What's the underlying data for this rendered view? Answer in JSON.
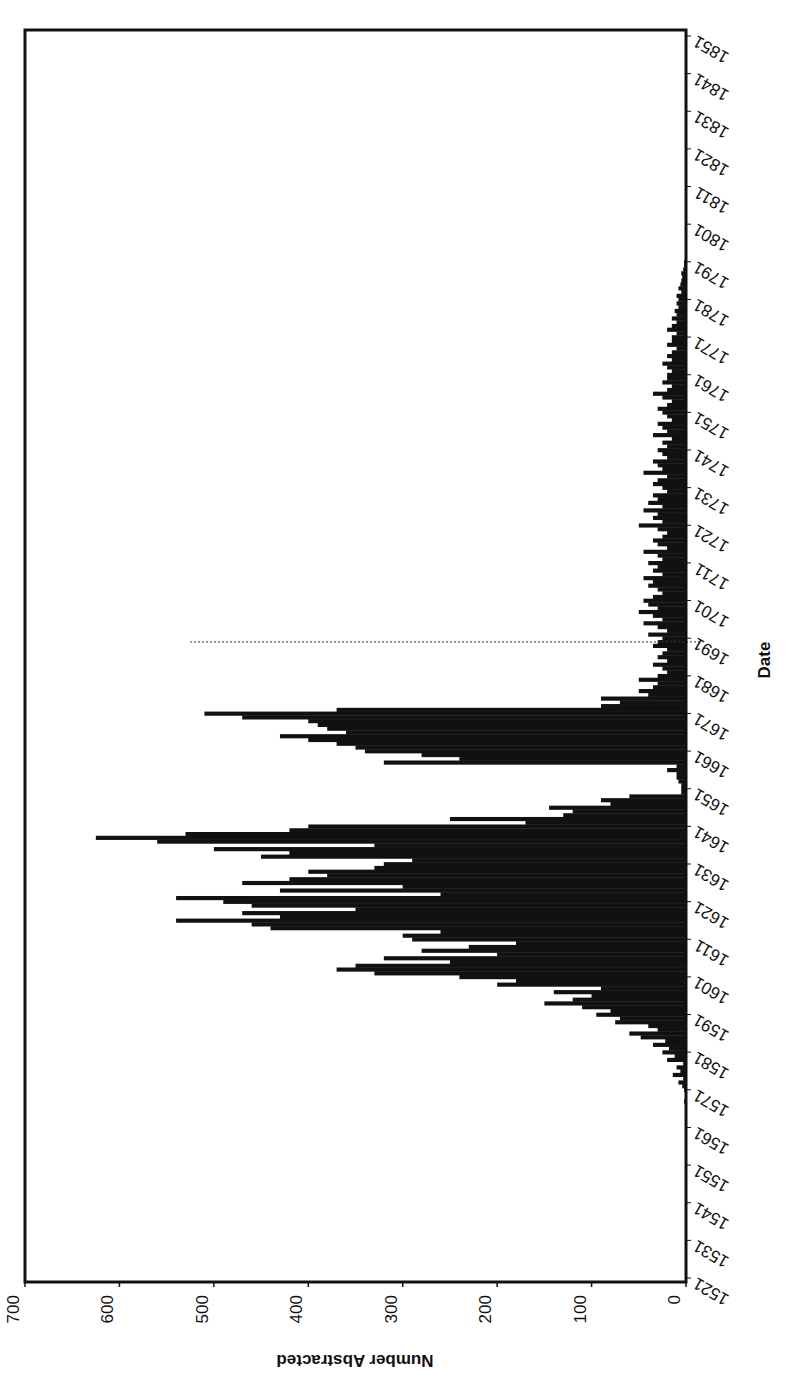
{
  "chart_data": {
    "type": "bar",
    "orientation": "rotated-90 (page printed sideways; value axis horizontal, reversed)",
    "title": "",
    "xlabel": "Date",
    "ylabel": "Number Abstracted",
    "ylim": [
      0,
      700
    ],
    "y_ticks": [
      0,
      100,
      200,
      300,
      400,
      500,
      600,
      700
    ],
    "x_tick_labels": [
      "1521",
      "1531",
      "1541",
      "1551",
      "1561",
      "1571",
      "1581",
      "1591",
      "1601",
      "1611",
      "1621",
      "1631",
      "1641",
      "1651",
      "1661",
      "1671",
      "1681",
      "1691",
      "1701",
      "1711",
      "1721",
      "1731",
      "1741",
      "1751",
      "1761",
      "1771",
      "1781",
      "1791",
      "1801",
      "1811",
      "1821",
      "1831",
      "1841",
      "1851"
    ],
    "xrange": [
      1521,
      1851
    ],
    "annotation": {
      "type": "dotted-reference-line",
      "at_year": 1690
    },
    "grid": false,
    "legend": null,
    "bar_color": "#111111",
    "categories_start": 1521,
    "values": [
      0,
      0,
      0,
      0,
      0,
      0,
      0,
      0,
      0,
      0,
      0,
      0,
      0,
      0,
      0,
      0,
      0,
      0,
      0,
      0,
      0,
      0,
      0,
      0,
      0,
      0,
      0,
      0,
      0,
      0,
      0,
      0,
      0,
      0,
      0,
      0,
      0,
      0,
      0,
      0,
      0,
      0,
      0,
      0,
      0,
      1,
      1,
      2,
      1,
      1,
      2,
      4,
      8,
      3,
      14,
      6,
      10,
      3,
      20,
      12,
      25,
      18,
      35,
      22,
      48,
      60,
      30,
      40,
      75,
      70,
      95,
      80,
      110,
      150,
      120,
      100,
      140,
      90,
      200,
      180,
      240,
      330,
      370,
      350,
      250,
      320,
      200,
      280,
      230,
      180,
      290,
      300,
      260,
      440,
      460,
      540,
      430,
      470,
      350,
      460,
      490,
      540,
      260,
      430,
      300,
      470,
      420,
      380,
      400,
      330,
      320,
      290,
      450,
      420,
      500,
      330,
      560,
      625,
      530,
      420,
      400,
      170,
      250,
      130,
      120,
      145,
      80,
      90,
      60,
      5,
      5,
      5,
      8,
      10,
      10,
      20,
      10,
      320,
      240,
      280,
      340,
      350,
      370,
      400,
      430,
      360,
      380,
      390,
      400,
      470,
      510,
      370,
      90,
      70,
      90,
      40,
      50,
      35,
      30,
      50,
      30,
      20,
      25,
      35,
      20,
      30,
      25,
      20,
      35,
      30,
      25,
      40,
      20,
      30,
      45,
      25,
      35,
      50,
      30,
      40,
      45,
      35,
      25,
      30,
      40,
      35,
      45,
      25,
      35,
      30,
      40,
      25,
      30,
      45,
      20,
      30,
      35,
      25,
      20,
      30,
      50,
      25,
      35,
      30,
      45,
      25,
      40,
      30,
      35,
      20,
      25,
      35,
      30,
      20,
      45,
      25,
      30,
      35,
      20,
      25,
      30,
      20,
      25,
      15,
      35,
      20,
      25,
      30,
      15,
      20,
      25,
      30,
      20,
      15,
      25,
      35,
      20,
      15,
      25,
      20,
      20,
      15,
      20,
      25,
      15,
      20,
      15,
      10,
      20,
      15,
      15,
      10,
      20,
      15,
      10,
      15,
      10,
      12,
      8,
      10,
      8,
      10,
      5,
      8,
      6,
      5,
      4,
      5,
      3,
      2,
      2,
      1,
      1,
      0,
      1,
      0,
      0,
      0,
      0,
      0,
      0,
      0,
      0,
      0,
      0,
      0,
      0,
      0,
      0,
      0,
      0,
      0,
      0,
      0,
      0,
      0,
      0,
      0,
      0,
      0,
      0,
      0,
      0,
      0,
      0,
      0,
      0,
      0,
      0,
      0,
      0,
      0,
      0,
      0,
      0,
      0,
      0,
      0,
      0,
      0,
      0,
      0,
      0,
      0,
      0,
      0,
      0,
      0,
      0,
      0,
      0
    ]
  },
  "axes": {
    "value_axis_title": "Number Abstracted",
    "date_axis_title": "Date"
  }
}
